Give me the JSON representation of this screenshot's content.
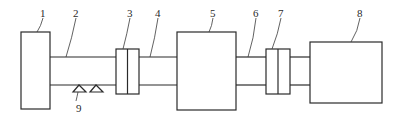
{
  "diagram": {
    "type": "mechanical-drivetrain-schematic",
    "colors": {
      "stroke": "#2a2a2a",
      "background": "#ffffff"
    },
    "components": [
      {
        "id": "1",
        "label": "1",
        "kind": "box"
      },
      {
        "id": "2",
        "label": "2",
        "kind": "shaft"
      },
      {
        "id": "3",
        "label": "3",
        "kind": "coupling"
      },
      {
        "id": "4",
        "label": "4",
        "kind": "shaft"
      },
      {
        "id": "5",
        "label": "5",
        "kind": "box"
      },
      {
        "id": "6",
        "label": "6",
        "kind": "shaft"
      },
      {
        "id": "7",
        "label": "7",
        "kind": "coupling"
      },
      {
        "id": "8",
        "label": "8",
        "kind": "box"
      },
      {
        "id": "9",
        "label": "9",
        "kind": "bearing-supports"
      }
    ],
    "connections": [
      [
        "1",
        "2"
      ],
      [
        "2",
        "3"
      ],
      [
        "3",
        "4"
      ],
      [
        "4",
        "5"
      ],
      [
        "5",
        "6"
      ],
      [
        "6",
        "7"
      ],
      [
        "7",
        "8"
      ]
    ]
  }
}
